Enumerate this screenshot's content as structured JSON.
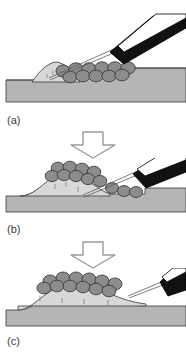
{
  "figure": {
    "width_px": 186,
    "height_px": 356,
    "background_color": "#ffffff"
  },
  "colors": {
    "substrate_fill": "#b5b5b5",
    "substrate_stroke": "#4a4a4a",
    "mound_fill": "#d8d8d8",
    "mound_stroke": "#4a4a4a",
    "particle_fill": "#8c8c8c",
    "particle_stroke": "#3c3c3c",
    "tool_body": "#111111",
    "tool_highlight": "#ffffff",
    "tool_stroke": "#000000",
    "needle_stroke": "#555555",
    "arrow_fill": "#ffffff",
    "arrow_stroke": "#9a9a9a",
    "label_text": "#3a3a3a"
  },
  "panels": [
    {
      "id": "a",
      "label": "(a)",
      "caption_text": "(a)",
      "description": "Small low mound at left on flat substrate; a cluster of rounded particles rests to the right of the mound; a dark angled handheld tool with a fine needle enters from the upper right and its needle tip touches the left mound.",
      "tool_position": "upper-right",
      "tool_angle_deg": -28,
      "mound_height": "low",
      "particle_count": 11
    },
    {
      "id": "b",
      "label": "(b)",
      "caption_text": "(b)",
      "description": "The mound has grown taller and wider and now carries particles on its crest; the tool has moved lower and to the right, its needle tip reaching the base of the particle pile at the right flank.",
      "tool_position": "right",
      "tool_angle_deg": -30,
      "mound_height": "medium",
      "particle_count": 12
    },
    {
      "id": "c",
      "label": "(c)",
      "caption_text": "(c)",
      "description": "A broad symmetric mound is fully capped by a continuous single layer of particles; the tool is withdrawn at the far right with its needle just clearing the right edge of the particle layer.",
      "tool_position": "far-right",
      "tool_angle_deg": -32,
      "mound_height": "high",
      "particle_count": 12
    }
  ],
  "arrows": [
    {
      "id": "arrow-1",
      "direction": "down",
      "between": "a-to-b"
    },
    {
      "id": "arrow-2",
      "direction": "down",
      "between": "b-to-c"
    }
  ]
}
